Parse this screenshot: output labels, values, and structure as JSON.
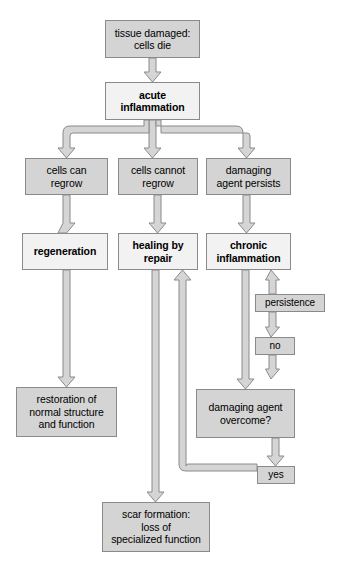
{
  "diagram": {
    "type": "flowchart",
    "colors": {
      "node_fill_gray": "#d4d4d4",
      "node_fill_white": "#f2f2f2",
      "node_border": "#8a8a8a",
      "arrow_fill": "#d0d0d0",
      "arrow_stroke": "#8a8a8a",
      "text": "#000000",
      "background": "#ffffff"
    },
    "nodes": [
      {
        "id": "tissue_damaged",
        "label": "tissue damaged:\ncells die",
        "line1": "tissue damaged:",
        "line2": "cells die",
        "line3": "",
        "style": "gray",
        "bold": false,
        "x": 105,
        "y": 20,
        "w": 95,
        "h": 38
      },
      {
        "id": "acute",
        "label": "acute\ninflammation",
        "line1": "acute",
        "line2": "inflammation",
        "line3": "",
        "style": "white",
        "bold": true,
        "x": 105,
        "y": 82,
        "w": 95,
        "h": 38
      },
      {
        "id": "cells_can",
        "label": "cells can\nregrow",
        "line1": "cells can",
        "line2": "regrow",
        "line3": "",
        "style": "gray",
        "bold": false,
        "x": 25,
        "y": 158,
        "w": 83,
        "h": 37
      },
      {
        "id": "cells_cannot",
        "label": "cells cannot\nregrow",
        "line1": "cells cannot",
        "line2": "regrow",
        "line3": "",
        "style": "gray",
        "bold": false,
        "x": 118,
        "y": 158,
        "w": 80,
        "h": 37
      },
      {
        "id": "damaging_agent",
        "label": "damaging\nagent persists",
        "line1": "damaging",
        "line2": "agent persists",
        "line3": "",
        "style": "gray",
        "bold": false,
        "x": 206,
        "y": 158,
        "w": 85,
        "h": 37
      },
      {
        "id": "regeneration",
        "label": "regeneration",
        "line1": "regeneration",
        "line2": "",
        "line3": "",
        "style": "white",
        "bold": true,
        "x": 22,
        "y": 233,
        "w": 86,
        "h": 37
      },
      {
        "id": "healing_repair",
        "label": "healing by\nrepair",
        "line1": "healing by",
        "line2": "repair",
        "line3": "",
        "style": "white",
        "bold": true,
        "x": 118,
        "y": 233,
        "w": 80,
        "h": 37
      },
      {
        "id": "chronic",
        "label": "chronic\ninflammation",
        "line1": "chronic",
        "line2": "inflammation",
        "line3": "",
        "style": "white",
        "bold": true,
        "x": 206,
        "y": 233,
        "w": 85,
        "h": 37
      },
      {
        "id": "persistence",
        "label": "persistence",
        "line1": "persistence",
        "line2": "",
        "line3": "",
        "style": "gray",
        "bold": false,
        "x": 255,
        "y": 294,
        "w": 70,
        "h": 18
      },
      {
        "id": "no",
        "label": "no",
        "line1": "no",
        "line2": "",
        "line3": "",
        "style": "gray",
        "bold": false,
        "x": 255,
        "y": 337,
        "w": 40,
        "h": 18
      },
      {
        "id": "restoration",
        "label": "restoration of\nnormal structure\nand function",
        "line1": "restoration of",
        "line2": "normal structure",
        "line3": "and function",
        "style": "gray",
        "bold": false,
        "x": 16,
        "y": 387,
        "w": 101,
        "h": 50
      },
      {
        "id": "overcome",
        "label": "damaging agent\novercome?",
        "line1": "damaging agent",
        "line2": "overcome?",
        "line3": "",
        "style": "gray",
        "bold": false,
        "x": 196,
        "y": 389,
        "w": 99,
        "h": 49
      },
      {
        "id": "yes",
        "label": "yes",
        "line1": "yes",
        "line2": "",
        "line3": "",
        "style": "gray",
        "bold": false,
        "x": 257,
        "y": 466,
        "w": 38,
        "h": 18
      },
      {
        "id": "scar",
        "label": "scar formation:\nloss of\nspecialized function",
        "line1": "scar formation:",
        "line2": "loss of",
        "line3": "specialized function",
        "style": "gray",
        "bold": false,
        "x": 102,
        "y": 502,
        "w": 108,
        "h": 50
      }
    ],
    "edges": [
      {
        "id": "e1",
        "from": "tissue_damaged",
        "to": "acute",
        "label": ""
      },
      {
        "id": "e2",
        "from": "acute",
        "to": "cells_can",
        "label": ""
      },
      {
        "id": "e3",
        "from": "acute",
        "to": "cells_cannot",
        "label": ""
      },
      {
        "id": "e4",
        "from": "acute",
        "to": "damaging_agent",
        "label": ""
      },
      {
        "id": "e5",
        "from": "cells_can",
        "to": "regeneration",
        "label": ""
      },
      {
        "id": "e6",
        "from": "cells_cannot",
        "to": "healing_repair",
        "label": ""
      },
      {
        "id": "e7",
        "from": "damaging_agent",
        "to": "chronic",
        "label": ""
      },
      {
        "id": "e8",
        "from": "regeneration",
        "to": "restoration",
        "label": ""
      },
      {
        "id": "e9",
        "from": "healing_repair",
        "to": "scar",
        "label": ""
      },
      {
        "id": "e10",
        "from": "chronic",
        "to": "overcome",
        "label": ""
      },
      {
        "id": "e11",
        "from": "overcome",
        "to": "no",
        "label": "no"
      },
      {
        "id": "e12",
        "from": "no",
        "to": "persistence",
        "label": ""
      },
      {
        "id": "e13",
        "from": "persistence",
        "to": "chronic",
        "label": ""
      },
      {
        "id": "e14",
        "from": "overcome",
        "to": "yes",
        "label": "yes"
      },
      {
        "id": "e15",
        "from": "yes",
        "to": "healing_repair",
        "label": ""
      }
    ]
  }
}
